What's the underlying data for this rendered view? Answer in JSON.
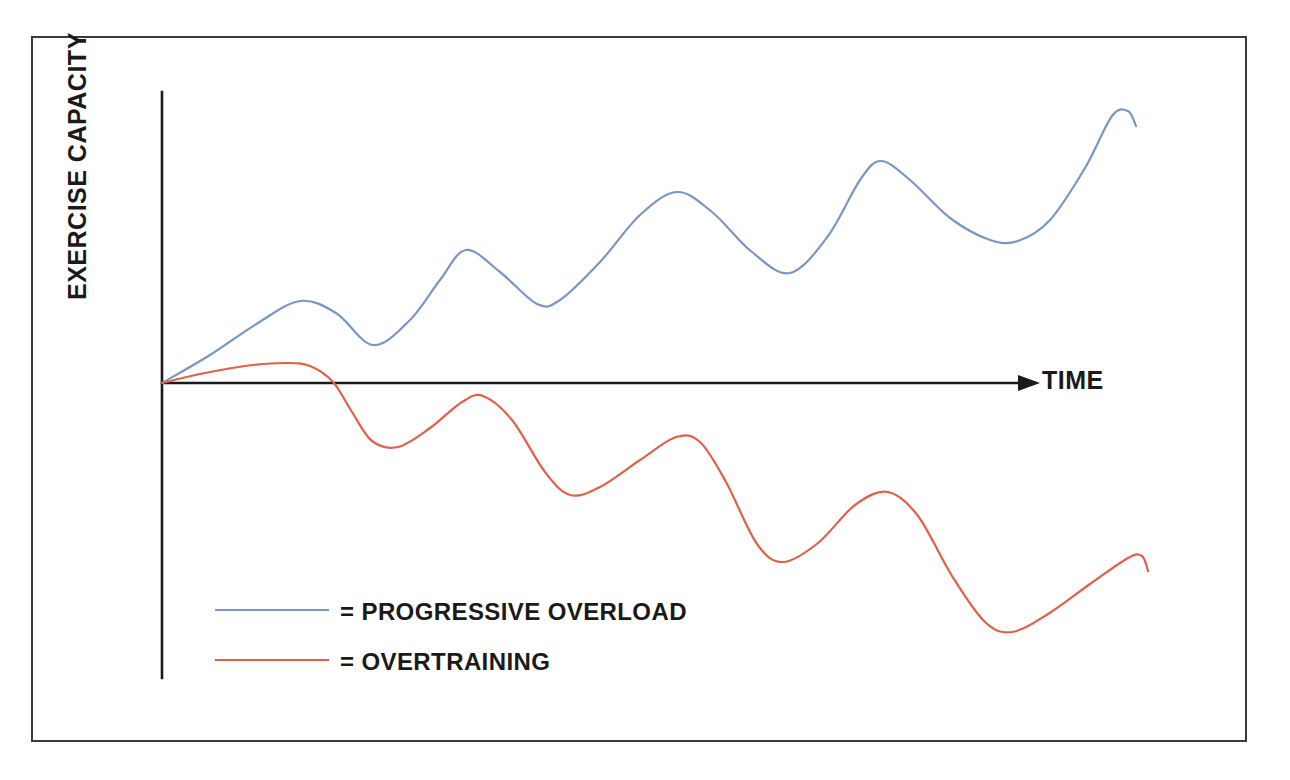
{
  "figure": {
    "background_color": "#ffffff",
    "frame_color": "#3b3b3b",
    "axis_color": "#1a1a1a"
  },
  "chart_data": {
    "type": "line",
    "title": "",
    "subtitle": "",
    "xlabel": "TIME",
    "ylabel": "EXERCISE CAPACITY",
    "xlim": [
      0,
      100
    ],
    "ylim": [
      -100,
      100
    ],
    "grid": false,
    "xticks": [],
    "yticks": [],
    "xticklabels": [],
    "yticklabels": [],
    "legend_position": "lower-left-inside",
    "annotations": [],
    "series": [
      {
        "name": "PROGRESSIVE OVERLOAD",
        "color": "#7b95c4",
        "legend_label": "= PROGRESSIVE OVERLOAD",
        "description": "Rising oscillating curve: each training cycle dips then rebounds to a higher peak, so capacity trends upward over time.",
        "x": [
          0,
          7,
          14,
          19,
          22,
          26,
          31,
          36,
          42,
          47,
          53,
          58,
          64,
          69,
          75,
          80,
          86,
          91,
          96,
          100
        ],
        "y": [
          0,
          11,
          22,
          28,
          27,
          21,
          16,
          21,
          33,
          41,
          36,
          29,
          33,
          47,
          59,
          52,
          44,
          49,
          63,
          74
        ],
        "path_points_px": [
          [
            162,
            383
          ],
          [
            210,
            355
          ],
          [
            258,
            323
          ],
          [
            300,
            301
          ],
          [
            336,
            313
          ],
          [
            373,
            345
          ],
          [
            410,
            320
          ],
          [
            440,
            280
          ],
          [
            466,
            250
          ],
          [
            500,
            272
          ],
          [
            537,
            304
          ],
          [
            560,
            300
          ],
          [
            600,
            262
          ],
          [
            640,
            215
          ],
          [
            677,
            192
          ],
          [
            712,
            212
          ],
          [
            752,
            252
          ],
          [
            790,
            273
          ],
          [
            828,
            236
          ],
          [
            860,
            180
          ],
          [
            881,
            161
          ],
          [
            910,
            180
          ],
          [
            950,
            218
          ],
          [
            990,
            240
          ],
          [
            1018,
            241
          ],
          [
            1050,
            220
          ],
          [
            1085,
            168
          ],
          [
            1112,
            116
          ],
          [
            1128,
            111
          ],
          [
            1136,
            126
          ]
        ]
      },
      {
        "name": "OVERTRAINING",
        "color": "#e0614a",
        "legend_label": "= OVERTRAINING",
        "description": "Oscillating curve that fails to recover fully: each cycle rebounds to a lower peak, so capacity trends downward below baseline over time.",
        "x": [
          0,
          8,
          15,
          20,
          24,
          29,
          35,
          40,
          46,
          52,
          58,
          63,
          69,
          74,
          80,
          85,
          90,
          95,
          100
        ],
        "y": [
          0,
          7,
          10,
          8,
          -10,
          -32,
          -22,
          -6,
          -14,
          -38,
          -60,
          -45,
          -28,
          -40,
          -66,
          -92,
          -99,
          -88,
          -70
        ],
        "path_points_px": [
          [
            162,
            383
          ],
          [
            205,
            373
          ],
          [
            245,
            366
          ],
          [
            285,
            363
          ],
          [
            310,
            366
          ],
          [
            333,
            382
          ],
          [
            352,
            412
          ],
          [
            372,
            441
          ],
          [
            398,
            447
          ],
          [
            430,
            428
          ],
          [
            462,
            402
          ],
          [
            483,
            396
          ],
          [
            512,
            420
          ],
          [
            545,
            472
          ],
          [
            570,
            495
          ],
          [
            600,
            487
          ],
          [
            640,
            460
          ],
          [
            676,
            437
          ],
          [
            700,
            442
          ],
          [
            726,
            482
          ],
          [
            757,
            544
          ],
          [
            783,
            562
          ],
          [
            818,
            543
          ],
          [
            855,
            505
          ],
          [
            888,
            492
          ],
          [
            918,
            516
          ],
          [
            952,
            576
          ],
          [
            985,
            622
          ],
          [
            1012,
            632
          ],
          [
            1048,
            614
          ],
          [
            1090,
            584
          ],
          [
            1128,
            558
          ],
          [
            1142,
            556
          ],
          [
            1148,
            571
          ]
        ]
      }
    ]
  },
  "legend": {
    "items": [
      {
        "label": "= PROGRESSIVE OVERLOAD",
        "color": "#7b95c4"
      },
      {
        "label": "= OVERTRAINING",
        "color": "#e0614a"
      }
    ]
  },
  "axes": {
    "y_axis_label": "EXERCISE CAPACITY",
    "x_axis_label": "TIME"
  }
}
